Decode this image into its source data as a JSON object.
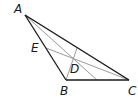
{
  "diagram": {
    "type": "triangle-geometry",
    "labels": {
      "A": "A",
      "B": "B",
      "C": "C",
      "D": "D",
      "E": "E"
    },
    "colors": {
      "triangle": "#1a1a1a",
      "inner_lines": "#8a8a8a",
      "label": "#1a1a1a"
    }
  }
}
